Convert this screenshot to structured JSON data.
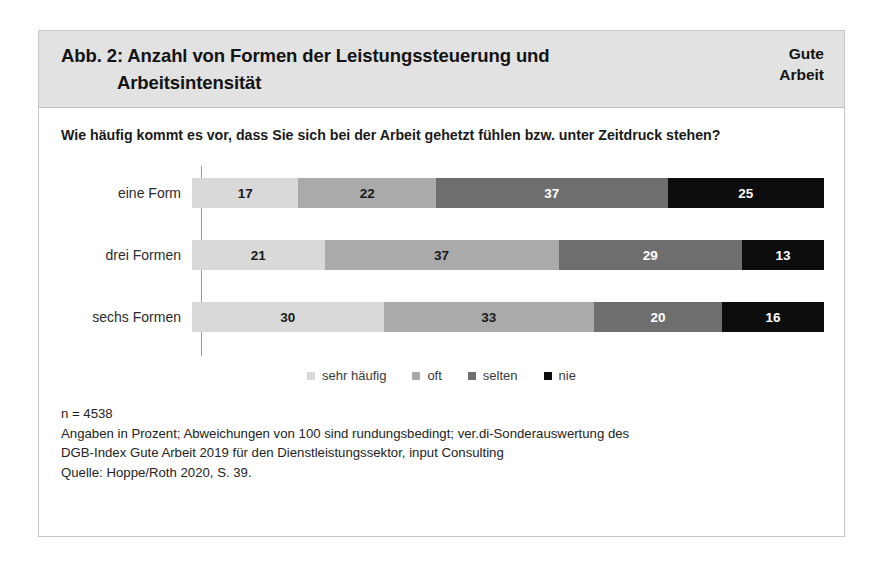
{
  "figure": {
    "header": {
      "title_line_1": "Abb. 2: Anzahl von Formen der Leistungssteuerung und",
      "title_line_2": "Arbeitsintensität",
      "brand_line_1": "Gute",
      "brand_line_2": "Arbeit"
    },
    "question": "Wie häufig kommt es vor, dass Sie sich bei der Arbeit gehetzt fühlen bzw. unter Zeitdruck stehen?",
    "footnotes": [
      "n = 4538",
      "Angaben in Prozent; Abweichungen von 100 sind rundungsbedingt; ver.di-Sonderauswertung des",
      "DGB-Index Gute Arbeit 2019 für den Dienstleistungssektor, input Consulting",
      "Quelle: Hoppe/Roth 2020, S. 39."
    ]
  },
  "chart_data": {
    "type": "bar",
    "orientation": "horizontal",
    "stacked": true,
    "title": "Abb. 2: Anzahl von Formen der Leistungssteuerung und Arbeitsintensität",
    "subtitle": "Wie häufig kommt es vor, dass Sie sich bei der Arbeit gehetzt fühlen bzw. unter Zeitdruck stehen?",
    "xlabel": "",
    "ylabel": "",
    "xlim": [
      0,
      101
    ],
    "grid": false,
    "legend_position": "bottom",
    "unit": "Prozent",
    "n": 4538,
    "categories": [
      "eine Form",
      "drei Formen",
      "sechs Formen"
    ],
    "series": [
      {
        "name": "sehr häufig",
        "color": "#d9d9d9",
        "label_color": "#1a1a1a",
        "values": [
          17,
          22,
          30
        ]
      },
      {
        "name": "oft",
        "color": "#aaaaaa",
        "label_color": "#1a1a1a",
        "values": [
          22,
          37,
          33
        ]
      },
      {
        "name": "selten",
        "color": "#6e6e6e",
        "label_color": "#ffffff",
        "values": [
          37,
          29,
          20
        ]
      },
      {
        "name": "nie",
        "color": "#0d0d0d",
        "label_color": "#ffffff",
        "values": [
          25,
          13,
          16
        ]
      }
    ],
    "rows": [
      {
        "label": "eine Form",
        "segments": [
          {
            "series": "sehr häufig",
            "value": 17,
            "value_label": "17",
            "color": "#d9d9d9",
            "label_color": "#1a1a1a"
          },
          {
            "series": "oft",
            "value": 22,
            "value_label": "22",
            "color": "#aaaaaa",
            "label_color": "#1a1a1a"
          },
          {
            "series": "selten",
            "value": 37,
            "value_label": "37",
            "color": "#6e6e6e",
            "label_color": "#ffffff"
          },
          {
            "series": "nie",
            "value": 25,
            "value_label": "25",
            "color": "#0d0d0d",
            "label_color": "#ffffff"
          }
        ]
      },
      {
        "label": "drei Formen",
        "segments": [
          {
            "series": "sehr häufig",
            "value": 21,
            "value_label": "21",
            "color": "#d9d9d9",
            "label_color": "#1a1a1a"
          },
          {
            "series": "oft",
            "value": 37,
            "value_label": "37",
            "color": "#aaaaaa",
            "label_color": "#1a1a1a"
          },
          {
            "series": "selten",
            "value": 29,
            "value_label": "29",
            "color": "#6e6e6e",
            "label_color": "#ffffff"
          },
          {
            "series": "nie",
            "value": 13,
            "value_label": "13",
            "color": "#0d0d0d",
            "label_color": "#ffffff"
          }
        ]
      },
      {
        "label": "sechs Formen",
        "segments": [
          {
            "series": "sehr häufig",
            "value": 30,
            "value_label": "30",
            "color": "#d9d9d9",
            "label_color": "#1a1a1a"
          },
          {
            "series": "oft",
            "value": 33,
            "value_label": "33",
            "color": "#aaaaaa",
            "label_color": "#1a1a1a"
          },
          {
            "series": "selten",
            "value": 20,
            "value_label": "20",
            "color": "#6e6e6e",
            "label_color": "#ffffff"
          },
          {
            "series": "nie",
            "value": 16,
            "value_label": "16",
            "color": "#0d0d0d",
            "label_color": "#ffffff"
          }
        ]
      }
    ],
    "legend": [
      {
        "label": "sehr häufig",
        "color": "#d9d9d9"
      },
      {
        "label": "oft",
        "color": "#aaaaaa"
      },
      {
        "label": "selten",
        "color": "#6e6e6e"
      },
      {
        "label": "nie",
        "color": "#0d0d0d"
      }
    ]
  }
}
